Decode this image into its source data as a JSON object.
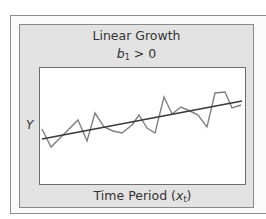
{
  "figure": {
    "title": "Linear Growth",
    "subtitle_var": "b",
    "subtitle_sub": "1",
    "subtitle_rest": " > 0",
    "y_axis_label": "Y",
    "x_axis_label_text": "Time Period (",
    "x_axis_label_var": "x",
    "x_axis_label_sub": "t",
    "x_axis_label_close": ")"
  },
  "colors": {
    "panel_background": "#e3e3e3",
    "plot_background": "#ffffff",
    "series_line": "#808080",
    "trend_line": "#3a3a3a",
    "text": "#333333"
  },
  "chart_data": {
    "type": "line",
    "title": "Linear Growth",
    "subtitle": "b1 > 0",
    "xlabel": "Time Period (x_t)",
    "ylabel": "Y",
    "grid": false,
    "legend": null,
    "ticks": "none",
    "series": [
      {
        "name": "observed",
        "style": "zigzag, gray",
        "points_px": [
          [
            42,
            129
          ],
          [
            51,
            147
          ],
          [
            78,
            120
          ],
          [
            87,
            141
          ],
          [
            95,
            113
          ],
          [
            104,
            127
          ],
          [
            113,
            131
          ],
          [
            122,
            133
          ],
          [
            132,
            125
          ],
          [
            139,
            115
          ],
          [
            147,
            128
          ],
          [
            155,
            133
          ],
          [
            164,
            97
          ],
          [
            172,
            114
          ],
          [
            181,
            107
          ],
          [
            190,
            111
          ],
          [
            198,
            115
          ],
          [
            207,
            127
          ],
          [
            215,
            93
          ],
          [
            225,
            92
          ],
          [
            232,
            108
          ],
          [
            241,
            105
          ]
        ]
      },
      {
        "name": "linear trend",
        "style": "straight, dark",
        "points_px": [
          [
            42,
            139
          ],
          [
            242,
            101
          ]
        ]
      }
    ]
  }
}
